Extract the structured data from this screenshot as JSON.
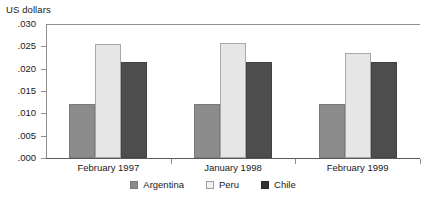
{
  "chart_data": {
    "type": "bar",
    "title": "",
    "subtitle": "",
    "xlabel": "",
    "ylabel": "US dollars",
    "ylim": [
      0.0,
      0.03
    ],
    "ytick_labels": [
      ".030",
      ".025",
      ".020",
      ".015",
      ".010",
      ".005",
      ".000"
    ],
    "ytick_values": [
      0.03,
      0.025,
      0.02,
      0.015,
      0.01,
      0.005,
      0.0
    ],
    "grid": false,
    "legend_position": "bottom-center",
    "categories": [
      "February 1997",
      "January 1998",
      "February 1999"
    ],
    "series": [
      {
        "name": "Argentina",
        "color": "#8c8c8c",
        "values": [
          0.012,
          0.012,
          0.012
        ]
      },
      {
        "name": "Peru",
        "color": "#e6e6e6",
        "values": [
          0.0256,
          0.0258,
          0.0235
        ]
      },
      {
        "name": "Chile",
        "color": "#4d4d4d",
        "values": [
          0.0215,
          0.0214,
          0.0214
        ]
      }
    ],
    "annotations": []
  },
  "source_note": ""
}
